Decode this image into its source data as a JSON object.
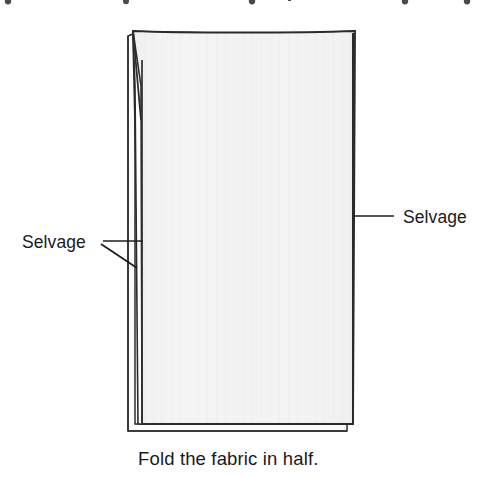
{
  "figure": {
    "type": "instructional-illustration",
    "background_color": "#ffffff",
    "caption": "Fold the fabric in half.",
    "clipped_header_text": "ghpyjgg",
    "labels": {
      "left": "Selvage",
      "right": "Selvage"
    },
    "colors": {
      "fabric_fill": "#f2f2f2",
      "fabric_fill_shadow": "#e8e8e8",
      "outline": "#2b2b2b",
      "texture": "#e6e6e6",
      "text": "#1a1a1a",
      "leader_line": "#1f1f1f"
    },
    "geometry": {
      "panel_top_left_x": 133,
      "panel_top_y": 31,
      "panel_top_right_x": 355,
      "panel_bottom_y": 424,
      "panel_left_x": 142,
      "panel_right_x": 353,
      "underlayer_left_x": 128,
      "underlayer_bottom_y": 431,
      "fold_spike_x": 133
    },
    "leaders": {
      "left_horizontal": {
        "x1": 103,
        "y1": 241,
        "x2": 143,
        "y2": 241
      },
      "left_diagonal": {
        "x1": 101,
        "y1": 244,
        "x2": 137,
        "y2": 268
      },
      "right_horizontal": {
        "x1": 353,
        "y1": 216,
        "x2": 394,
        "y2": 216
      }
    },
    "text_positions": {
      "left_label_x": 22,
      "left_label_y": 248,
      "right_label_x": 403,
      "right_label_y": 223,
      "caption_x": 138,
      "caption_y": 465
    }
  }
}
